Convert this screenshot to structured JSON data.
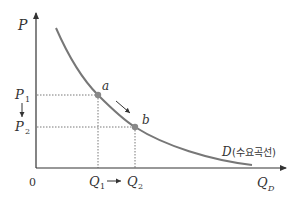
{
  "diagram": {
    "title": "",
    "type": "demand-curve",
    "colors": {
      "axis": "#333333",
      "curve": "#777777",
      "point": "#888888",
      "guide": "#555555",
      "text": "#333333"
    },
    "axes": {
      "y_label": "P",
      "x_label_main": "Q",
      "x_label_sub": "D",
      "origin_label": "0"
    },
    "price_labels": [
      {
        "main": "P",
        "sub": "1"
      },
      {
        "main": "P",
        "sub": "2"
      }
    ],
    "quantity_labels": [
      {
        "main": "Q",
        "sub": "1"
      },
      {
        "main": "Q",
        "sub": "2"
      }
    ],
    "points": [
      {
        "label": "a"
      },
      {
        "label": "b"
      }
    ],
    "curve_label": {
      "main": "D",
      "korean": "(수요곡선)"
    }
  }
}
